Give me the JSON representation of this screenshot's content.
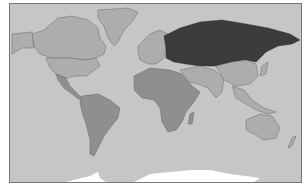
{
  "map": {
    "title": "",
    "type": "world choropleth (grayscale)",
    "colors": {
      "ocean": "#c6c6c6",
      "land_light": "#adadad",
      "land_mid": "#8f8f8f",
      "highlight": "#3c3c3c",
      "ice": "#ffffff",
      "border": "#555555"
    },
    "highlighted_region": "Russia"
  }
}
